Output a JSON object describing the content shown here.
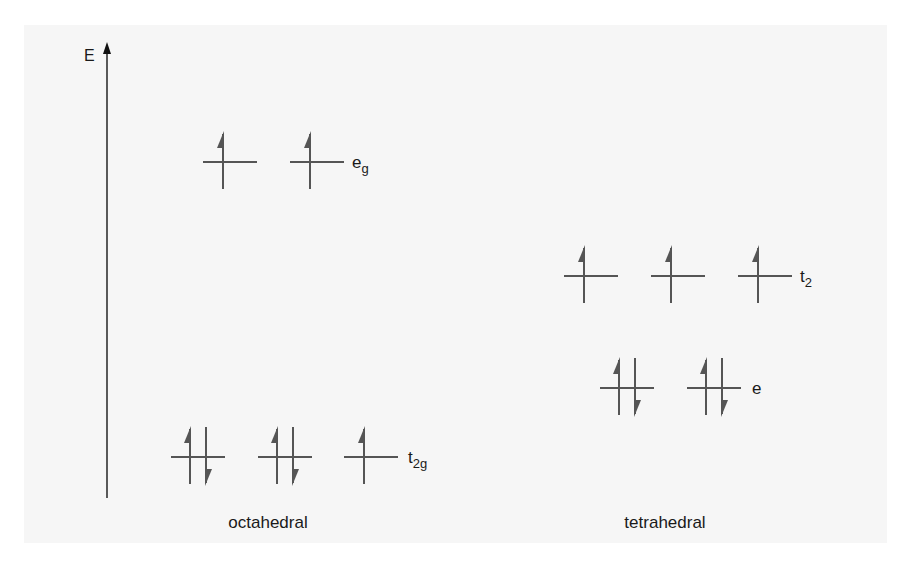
{
  "diagram": {
    "colors": {
      "panel_bg": "#f6f6f6",
      "stroke": "#555555",
      "text": "#1a1a1a"
    },
    "axis": {
      "label": "E",
      "x": 107,
      "y_top": 45,
      "y_bottom": 498
    },
    "fields": [
      {
        "name": "octahedral",
        "caption": "octahedral",
        "caption_x": 268,
        "levels": [
          {
            "name": "eg",
            "label_main": "e",
            "label_sub": "g",
            "y": 162,
            "label_x": 352,
            "orbitals": [
              {
                "x": 203,
                "electrons": "up"
              },
              {
                "x": 290,
                "electrons": "up"
              }
            ]
          },
          {
            "name": "t2g",
            "label_main": "t",
            "label_sub": "2g",
            "y": 457,
            "label_x": 408,
            "orbitals": [
              {
                "x": 171,
                "electrons": "pair"
              },
              {
                "x": 258,
                "electrons": "pair"
              },
              {
                "x": 344,
                "electrons": "up"
              }
            ]
          }
        ]
      },
      {
        "name": "tetrahedral",
        "caption": "tetrahedral",
        "caption_x": 665,
        "levels": [
          {
            "name": "t2",
            "label_main": "t",
            "label_sub": "2",
            "y": 276,
            "label_x": 800,
            "orbitals": [
              {
                "x": 564,
                "electrons": "up"
              },
              {
                "x": 651,
                "electrons": "up"
              },
              {
                "x": 738,
                "electrons": "up"
              }
            ]
          },
          {
            "name": "e",
            "label_main": "e",
            "label_sub": "",
            "y": 388,
            "label_x": 752,
            "orbitals": [
              {
                "x": 600,
                "electrons": "pair"
              },
              {
                "x": 687,
                "electrons": "pair"
              }
            ]
          }
        ]
      }
    ],
    "caption_y": 528,
    "orbital_width": 54
  }
}
